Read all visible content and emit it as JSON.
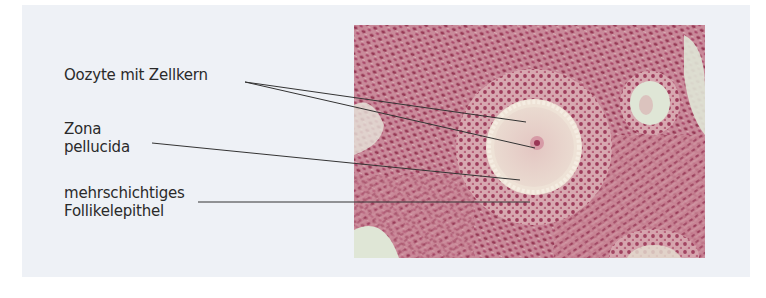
{
  "figure": {
    "labels": [
      {
        "id": "oocyte",
        "lines": [
          "Oozyte mit Zellkern"
        ]
      },
      {
        "id": "zona",
        "lines": [
          "Zona",
          "pellucida"
        ]
      },
      {
        "id": "follicle-epithelium",
        "lines": [
          "mehrschichtiges",
          "Follikelepithel"
        ]
      }
    ],
    "micrograph": {
      "description": "Histological section of ovarian follicle (secondary follicle) stained pink/magenta",
      "colors": {
        "stroma": "#c98a9a",
        "nuclei": "#8e2a4a",
        "clear_area": "#dfe6d6",
        "oocyte": "#e6cfc8",
        "zona": "#efe4d8"
      }
    },
    "colors": {
      "panel_background": "#eef1f6",
      "text": "#2a2a2a",
      "leader_line": "#333333"
    }
  }
}
